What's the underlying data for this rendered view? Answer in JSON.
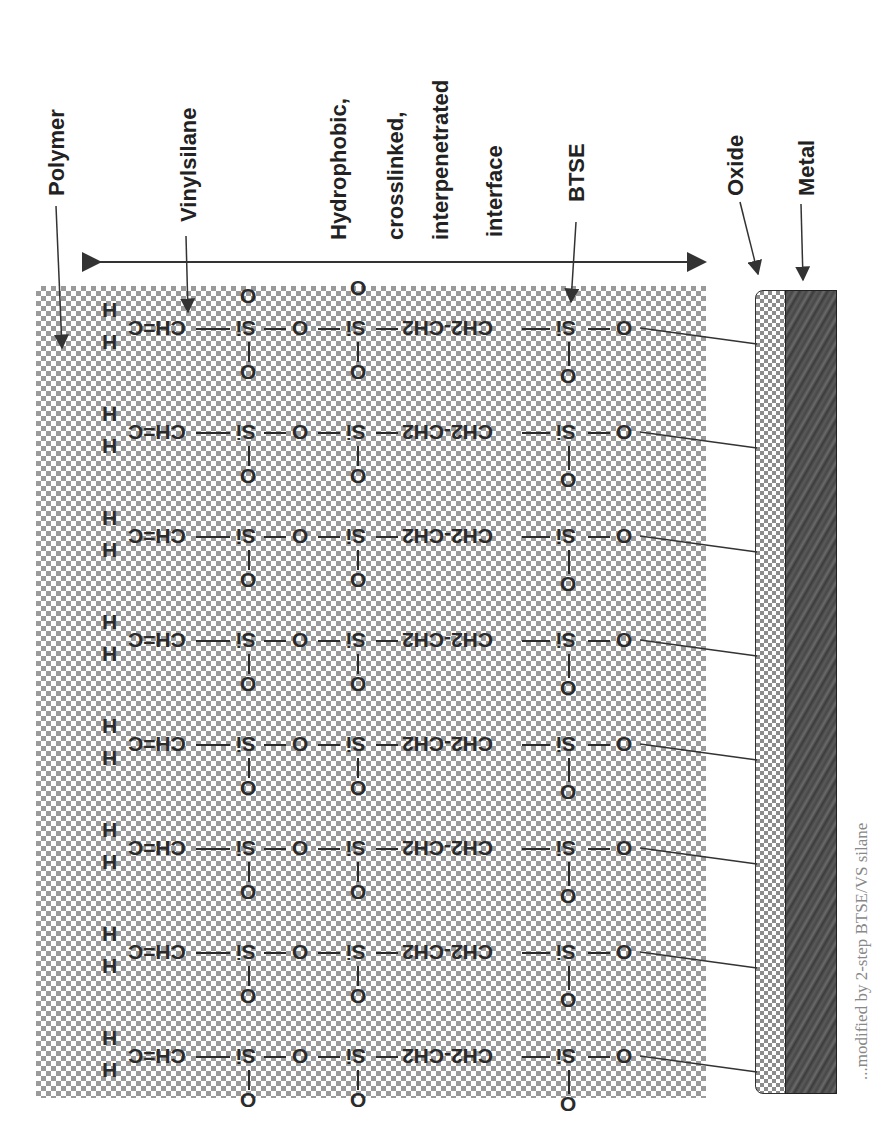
{
  "figure": {
    "labels": {
      "polymer": "Polymer",
      "vinylsilane": "Vinylsilane",
      "interface_line1": "Hydrophobic,",
      "interface_line2": "crosslinked,",
      "interface_line3": "interpenetrated",
      "interface_line4": "interface",
      "btse": "BTSE",
      "oxide": "Oxide",
      "metal": "Metal"
    },
    "atoms": {
      "h": "H",
      "vinyl": "CH=C",
      "ch": "CH",
      "si_vs": "Si",
      "o": "O",
      "si_btse_inner": "Si",
      "ethylene": "CH2-CH2",
      "si": "Si"
    },
    "row_count": 8,
    "caption_fragment": "...modified by 2-step BTSE/VS silane",
    "colors": {
      "checker_polymer": "#9a9a9a",
      "checker_oxide": "#8c8c8c",
      "metal": "#4a4a4a",
      "text": "#2b2b2b"
    }
  }
}
